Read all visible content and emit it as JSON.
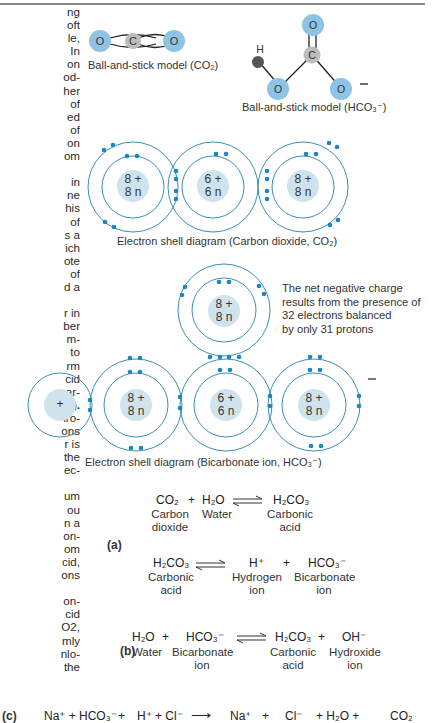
{
  "left_column_fragments": [
    "ng",
    "oft",
    "le,",
    "In",
    "on",
    "od-",
    "her",
    "of",
    "ed",
    "of",
    "on",
    "om",
    "",
    "in",
    "ne",
    "his",
    "of",
    "s a",
    "ich",
    "ote",
    "of",
    "d a",
    "",
    "r in",
    "ber",
    "m-",
    "to",
    "rm",
    "cid",
    "ar-",
    "a).",
    "lro-",
    "ons",
    "r is",
    "the",
    "ec-",
    "",
    "um",
    "ou",
    "n a",
    "on-",
    "om",
    "cid,",
    "ons",
    "",
    "on-",
    "cid",
    "O2,",
    "mly",
    "nlo-",
    "the"
  ],
  "ball_stick_co2": {
    "atoms": [
      "O",
      "C",
      "O"
    ],
    "caption": "Ball-and-stick model (CO₂)"
  },
  "ball_stick_hco3": {
    "atoms": [
      "H",
      "O",
      "C",
      "O",
      "O"
    ],
    "charge": "–",
    "caption": "Ball-and-stick model (HCO₃⁻)"
  },
  "shell_co2": {
    "atoms": [
      {
        "line1": "8 +",
        "line2": "8 n"
      },
      {
        "line1": "6 +",
        "line2": "6 n"
      },
      {
        "line1": "8 +",
        "line2": "8 n"
      }
    ],
    "caption": "Electron shell diagram (Carbon dioxide, CO₂)"
  },
  "shell_hco3": {
    "hydrogen": "+",
    "atoms": [
      {
        "line1": "8 +",
        "line2": "8 n"
      },
      {
        "line1": "8 +",
        "line2": "8 n"
      },
      {
        "line1": "6 +",
        "line2": "6 n"
      },
      {
        "line1": "8 +",
        "line2": "8 n"
      }
    ],
    "charge": "–",
    "note": [
      "The net negative charge",
      "results from the presence of",
      "32 electrons balanced",
      "by only 31 protons"
    ],
    "caption": "Electron shell diagram (Bicarbonate ion, HCO₃⁻)"
  },
  "equations": {
    "a_label": "(a)",
    "a1": {
      "lhs1": "CO₂",
      "plus": "+",
      "lhs2": "H₂O",
      "rhs1": "H₂CO₃",
      "lbl_lhs1": [
        "Carbon",
        "dioxide"
      ],
      "lbl_lhs2": [
        "Water"
      ],
      "lbl_rhs1": [
        "Carbonic",
        "acid"
      ]
    },
    "a2": {
      "lhs1": "H₂CO₃",
      "rhs1": "H⁺",
      "plus": "+",
      "rhs2": "HCO₃⁻",
      "lbl_lhs1": [
        "Carbonic",
        "acid"
      ],
      "lbl_rhs1": [
        "Hydrogen",
        "ion"
      ],
      "lbl_rhs2": [
        "Bicarbonate",
        "ion"
      ]
    },
    "b_label": "(b)",
    "b": {
      "lhs1": "H₂O",
      "plus1": "+",
      "lhs2": "HCO₃⁻",
      "rhs1": "H₂CO₃",
      "plus2": "+",
      "rhs2": "OH⁻",
      "lbl_lhs1": [
        "Water"
      ],
      "lbl_lhs2": [
        "Bicarbonate",
        "ion"
      ],
      "lbl_rhs1": [
        "Carbonic",
        "acid"
      ],
      "lbl_rhs2": [
        "Hydroxide",
        "ion"
      ]
    },
    "c_label": "(c)",
    "c": {
      "terms": [
        "Na⁺ + HCO₃⁻",
        "+",
        "H⁺ + Cl⁻",
        "⟶",
        "Na⁺",
        "+",
        "Cl⁻",
        "+ H₂O +",
        "CO₂"
      ]
    }
  },
  "colors": {
    "oxygen": "#8ec3e3",
    "carbon": "#bdbdbd",
    "hydrogen_ball": "#555555",
    "nucleus": "#cfe3ec",
    "shell": "#3a8fb7",
    "electron": "#1c86c2",
    "text": "#2a2a2a"
  }
}
